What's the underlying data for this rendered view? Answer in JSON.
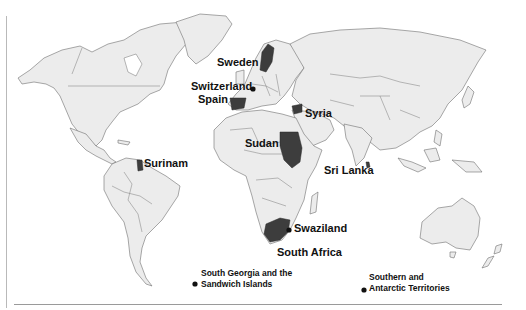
{
  "map": {
    "type": "world-political-outline",
    "colors": {
      "land": "#ececec",
      "border": "#6f6f6f",
      "highlight": "#3d3d3d",
      "ocean": "#ffffff",
      "label": "#111111"
    },
    "highlighted_countries": [
      "Sweden",
      "Spain",
      "Syria",
      "Sudan",
      "Surinam",
      "South Africa",
      "Sri Lanka"
    ],
    "dot_markers": [
      "Switzerland",
      "Swaziland",
      "South Georgia and the Sandwich Islands",
      "Southern and Antarctic Territories"
    ]
  },
  "labels": {
    "sweden": "Sweden",
    "switzerland": "Switzerland",
    "spain": "Spain",
    "syria": "Syria",
    "sudan": "Sudan",
    "surinam": "Surinam",
    "sri_lanka": "Sri Lanka",
    "swaziland": "Swaziland",
    "south_africa": "South Africa",
    "south_georgia_line1": "South Georgia and the",
    "south_georgia_line2": "Sandwich Islands",
    "southern_antarctic_line1": "Southern and",
    "southern_antarctic_line2": "Antarctic Territories"
  }
}
